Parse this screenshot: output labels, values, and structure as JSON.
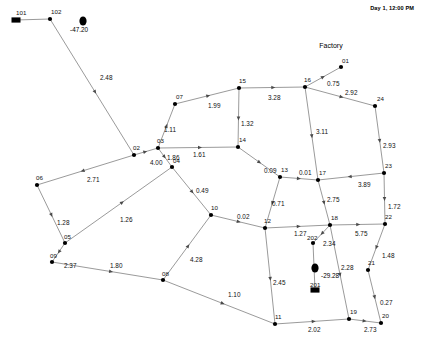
{
  "header": {
    "clock": "Day 1, 12:00 PM"
  },
  "annotations": {
    "factory_label": "Factory",
    "depot_value": "-47.20",
    "truck_value": "-29.28"
  },
  "nodes": [
    {
      "id": "101",
      "label": "101",
      "x": 16,
      "y": 20,
      "kind": "depot",
      "label_dx": 0,
      "label_dy": -5
    },
    {
      "id": "102",
      "label": "102",
      "x": 50,
      "y": 19,
      "kind": "plain",
      "label_dx": 1,
      "label_dy": -5
    },
    {
      "id": "01",
      "label": "01",
      "x": 341,
      "y": 67,
      "kind": "plain",
      "label_dx": 1,
      "label_dy": -4
    },
    {
      "id": "02",
      "label": "02",
      "x": 134,
      "y": 155,
      "kind": "plain",
      "label_dx": -1,
      "label_dy": -5
    },
    {
      "id": "03",
      "label": "03",
      "x": 158,
      "y": 148,
      "kind": "plain",
      "label_dx": -1,
      "label_dy": -5
    },
    {
      "id": "04",
      "label": "04",
      "x": 172,
      "y": 167,
      "kind": "plain",
      "label_dx": 1,
      "label_dy": -4
    },
    {
      "id": "05",
      "label": "05",
      "x": 65,
      "y": 243,
      "kind": "plain",
      "label_dx": -1,
      "label_dy": -4
    },
    {
      "id": "06",
      "label": "06",
      "x": 37,
      "y": 185,
      "kind": "plain",
      "label_dx": -1,
      "label_dy": -5
    },
    {
      "id": "07",
      "label": "07",
      "x": 175,
      "y": 104,
      "kind": "plain",
      "label_dx": 1,
      "label_dy": -5
    },
    {
      "id": "08",
      "label": "08",
      "x": 163,
      "y": 280,
      "kind": "plain",
      "label_dx": -1,
      "label_dy": -4
    },
    {
      "id": "09",
      "label": "09",
      "x": 52,
      "y": 262,
      "kind": "plain",
      "label_dx": -2,
      "label_dy": -4
    },
    {
      "id": "10",
      "label": "10",
      "x": 211,
      "y": 215,
      "kind": "plain",
      "label_dx": 0,
      "label_dy": -5
    },
    {
      "id": "11",
      "label": "11",
      "x": 275,
      "y": 324,
      "kind": "plain",
      "label_dx": 0,
      "label_dy": -5
    },
    {
      "id": "12",
      "label": "12",
      "x": 265,
      "y": 228,
      "kind": "plain",
      "label_dx": -1,
      "label_dy": -5
    },
    {
      "id": "13",
      "label": "13",
      "x": 280,
      "y": 177,
      "kind": "plain",
      "label_dx": 1,
      "label_dy": -5
    },
    {
      "id": "14",
      "label": "14",
      "x": 238,
      "y": 147,
      "kind": "plain",
      "label_dx": 1,
      "label_dy": -5
    },
    {
      "id": "15",
      "label": "15",
      "x": 239,
      "y": 88,
      "kind": "plain",
      "label_dx": 0,
      "label_dy": -5
    },
    {
      "id": "16",
      "label": "16",
      "x": 305,
      "y": 87,
      "kind": "plain",
      "label_dx": -1,
      "label_dy": -5
    },
    {
      "id": "17",
      "label": "17",
      "x": 318,
      "y": 180,
      "kind": "plain",
      "label_dx": 1,
      "label_dy": -5
    },
    {
      "id": "18",
      "label": "18",
      "x": 330,
      "y": 225,
      "kind": "plain",
      "label_dx": 1,
      "label_dy": -5
    },
    {
      "id": "19",
      "label": "19",
      "x": 349,
      "y": 319,
      "kind": "plain",
      "label_dx": 1,
      "label_dy": -5
    },
    {
      "id": "20",
      "label": "20",
      "x": 381,
      "y": 323,
      "kind": "plain",
      "label_dx": 1,
      "label_dy": -5
    },
    {
      "id": "21",
      "label": "21",
      "x": 368,
      "y": 270,
      "kind": "plain",
      "label_dx": 0,
      "label_dy": -5
    },
    {
      "id": "22",
      "label": "22",
      "x": 385,
      "y": 224,
      "kind": "plain",
      "label_dx": 0,
      "label_dy": -5
    },
    {
      "id": "23",
      "label": "23",
      "x": 384,
      "y": 173,
      "kind": "plain",
      "label_dx": 1,
      "label_dy": -5
    },
    {
      "id": "24",
      "label": "24",
      "x": 375,
      "y": 106,
      "kind": "plain",
      "label_dx": 2,
      "label_dy": -5
    },
    {
      "id": "202",
      "label": "202",
      "x": 313,
      "y": 243,
      "kind": "plain",
      "label_dx": -6,
      "label_dy": -3
    },
    {
      "id": "201",
      "label": "201",
      "x": 315,
      "y": 290,
      "kind": "depot",
      "label_dx": -5,
      "label_dy": -3
    }
  ],
  "edges": [
    {
      "from": "101",
      "to": "102",
      "weight": "",
      "lx": 0,
      "ly": 0,
      "arrow": false
    },
    {
      "from": "102",
      "to": "02",
      "weight": "2.48",
      "lx": 100,
      "ly": 80,
      "arrow": true
    },
    {
      "from": "02",
      "to": "03",
      "weight": "4.00",
      "lx": 150,
      "ly": 165,
      "arrow": true
    },
    {
      "from": "03",
      "to": "07",
      "weight": "1.11",
      "lx": 164,
      "ly": 132,
      "arrow": true
    },
    {
      "from": "07",
      "to": "15",
      "weight": "1.99",
      "lx": 208,
      "ly": 108,
      "arrow": true
    },
    {
      "from": "15",
      "to": "16",
      "weight": "3.28",
      "lx": 268,
      "ly": 100,
      "arrow": true
    },
    {
      "from": "15",
      "to": "14",
      "weight": "1.32",
      "lx": 241,
      "ly": 126,
      "arrow": true
    },
    {
      "from": "03",
      "to": "14",
      "weight": "1.61",
      "lx": 193,
      "ly": 157,
      "arrow": true
    },
    {
      "from": "03",
      "to": "04",
      "weight": "1.86",
      "lx": 167,
      "ly": 160,
      "arrow": true
    },
    {
      "from": "04",
      "to": "10",
      "weight": "0.49",
      "lx": 196,
      "ly": 193,
      "arrow": true
    },
    {
      "from": "16",
      "to": "01",
      "weight": "0.75",
      "lx": 327,
      "ly": 86,
      "arrow": true
    },
    {
      "from": "16",
      "to": "24",
      "weight": "2.92",
      "lx": 345,
      "ly": 95,
      "arrow": true
    },
    {
      "from": "16",
      "to": "17",
      "weight": "3.11",
      "lx": 316,
      "ly": 134,
      "arrow": true
    },
    {
      "from": "24",
      "to": "23",
      "weight": "2.93",
      "lx": 383,
      "ly": 148,
      "arrow": true
    },
    {
      "from": "23",
      "to": "17",
      "weight": "3.89",
      "lx": 358,
      "ly": 187,
      "arrow": true
    },
    {
      "from": "23",
      "to": "22",
      "weight": "1.72",
      "lx": 388,
      "ly": 209,
      "arrow": true
    },
    {
      "from": "14",
      "to": "13",
      "weight": "0.09",
      "lx": 264,
      "ly": 173,
      "arrow": true
    },
    {
      "from": "13",
      "to": "17",
      "weight": "0.01",
      "lx": 299,
      "ly": 175,
      "arrow": true
    },
    {
      "from": "13",
      "to": "12",
      "weight": "0.71",
      "lx": 272,
      "ly": 206,
      "arrow": true
    },
    {
      "from": "17",
      "to": "18",
      "weight": "2.75",
      "lx": 327,
      "ly": 202,
      "arrow": true
    },
    {
      "from": "10",
      "to": "12",
      "weight": "0.02",
      "lx": 237,
      "ly": 219,
      "arrow": true
    },
    {
      "from": "12",
      "to": "18",
      "weight": "1.27",
      "lx": 294,
      "ly": 236,
      "arrow": true
    },
    {
      "from": "18",
      "to": "22",
      "weight": "5.75",
      "lx": 355,
      "ly": 236,
      "arrow": true
    },
    {
      "from": "18",
      "to": "202",
      "weight": "2.34",
      "lx": 323,
      "ly": 246,
      "arrow": true
    },
    {
      "from": "22",
      "to": "21",
      "weight": "1.48",
      "lx": 382,
      "ly": 258,
      "arrow": true
    },
    {
      "from": "18",
      "to": "19",
      "weight": "2.28",
      "lx": 341,
      "ly": 270,
      "arrow": true
    },
    {
      "from": "21",
      "to": "20",
      "weight": "0.27",
      "lx": 380,
      "ly": 305,
      "arrow": true
    },
    {
      "from": "12",
      "to": "11",
      "weight": "2.45",
      "lx": 273,
      "ly": 285,
      "arrow": true
    },
    {
      "from": "11",
      "to": "19",
      "weight": "2.02",
      "lx": 308,
      "ly": 332,
      "arrow": true
    },
    {
      "from": "19",
      "to": "20",
      "weight": "2.73",
      "lx": 364,
      "ly": 332,
      "arrow": true
    },
    {
      "from": "02",
      "to": "06",
      "weight": "2.71",
      "lx": 87,
      "ly": 182,
      "arrow": true
    },
    {
      "from": "06",
      "to": "05",
      "weight": "1.28",
      "lx": 57,
      "ly": 225,
      "arrow": true
    },
    {
      "from": "05",
      "to": "04",
      "weight": "1.26",
      "lx": 120,
      "ly": 222,
      "arrow": true
    },
    {
      "from": "05",
      "to": "09",
      "weight": "2.37",
      "lx": 64,
      "ly": 268,
      "arrow": true
    },
    {
      "from": "09",
      "to": "08",
      "weight": "1.80",
      "lx": 110,
      "ly": 268,
      "arrow": true
    },
    {
      "from": "08",
      "to": "10",
      "weight": "4.28",
      "lx": 190,
      "ly": 262,
      "arrow": true
    },
    {
      "from": "08",
      "to": "11",
      "weight": "1.10",
      "lx": 228,
      "ly": 297,
      "arrow": true
    },
    {
      "from": "202",
      "to": "201",
      "weight": "",
      "lx": 0,
      "ly": 0,
      "arrow": false
    }
  ],
  "vehicles": [
    {
      "id": "truck-101",
      "x": 83,
      "y": 21,
      "value_x": 70,
      "value_y": 32
    },
    {
      "id": "truck-201",
      "x": 315,
      "y": 268,
      "value_x": 321,
      "value_y": 278
    }
  ]
}
